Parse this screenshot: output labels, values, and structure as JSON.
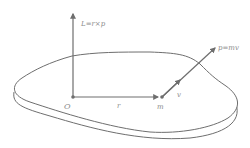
{
  "diagram": {
    "labels": {
      "angular_momentum": "L=r×p",
      "momentum": "p=mv",
      "velocity": "v",
      "position": "r",
      "origin": "O",
      "mass": "m"
    },
    "colors": {
      "line": "#6e6e6e",
      "text": "#8a8a8a",
      "background": "#ffffff"
    }
  }
}
